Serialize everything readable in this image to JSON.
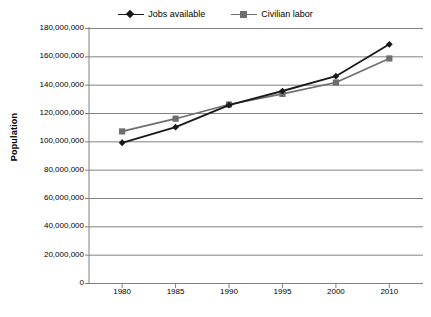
{
  "chart_data": {
    "type": "line",
    "title": "",
    "xlabel": "",
    "ylabel": "Population",
    "categories": [
      "1980",
      "1985",
      "1990",
      "1995",
      "2000",
      "2010"
    ],
    "x": [
      1980,
      1985,
      1990,
      1995,
      2000,
      2010
    ],
    "series": [
      {
        "name": "Jobs available",
        "marker": "diamond",
        "color": "#1a1a1a",
        "values": [
          99000000,
          110000000,
          125500000,
          135500000,
          146000000,
          168500000
        ]
      },
      {
        "name": "Civilian labor",
        "marker": "square",
        "color": "#6e6e6e",
        "values": [
          107000000,
          116000000,
          126000000,
          133500000,
          141500000,
          158500000
        ]
      }
    ],
    "ylim": [
      0,
      180000000
    ],
    "ytick_values": [
      0,
      20000000,
      40000000,
      60000000,
      80000000,
      100000000,
      120000000,
      140000000,
      160000000,
      180000000
    ],
    "ytick_labels": [
      "180,000,000",
      "160,000,000",
      "140,000,000",
      "120,000,000",
      "100,000,000",
      "80,000,000",
      "60,000,000",
      "40,000,000",
      "20,000,000",
      "0"
    ],
    "grid": "horizontal",
    "legend_position": "top-center",
    "legend": [
      {
        "label": "Jobs available",
        "marker": "diamond",
        "color": "#1a1a1a"
      },
      {
        "label": "Civilian labor",
        "marker": "square",
        "color": "#6e6e6e"
      }
    ]
  },
  "colors": {
    "jobs_available": "#1a1a1a",
    "civilian_labor": "#6e6e6e",
    "gridline": "#808080",
    "axis": "#808080",
    "background": "#ffffff",
    "text": "#000000"
  },
  "axis": {
    "y_title": "Population"
  }
}
